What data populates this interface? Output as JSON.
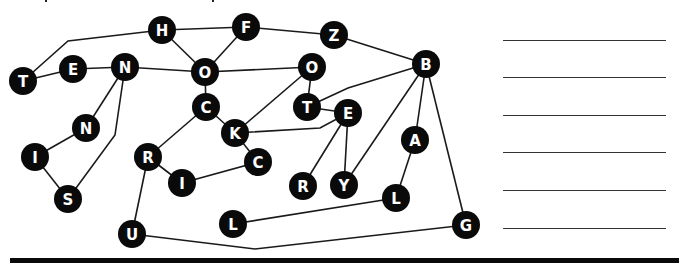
{
  "puzzle": {
    "type": "letter-path-graph",
    "nodes": [
      {
        "id": "H",
        "label": "H",
        "x": 162,
        "y": 30
      },
      {
        "id": "F",
        "label": "F",
        "x": 246,
        "y": 27
      },
      {
        "id": "Z",
        "label": "Z",
        "x": 334,
        "y": 35
      },
      {
        "id": "B",
        "label": "B",
        "x": 426,
        "y": 64
      },
      {
        "id": "T1",
        "label": "T",
        "x": 23,
        "y": 81
      },
      {
        "id": "E1",
        "label": "E",
        "x": 73,
        "y": 69
      },
      {
        "id": "N1",
        "label": "N",
        "x": 125,
        "y": 67
      },
      {
        "id": "O1",
        "label": "O",
        "x": 205,
        "y": 72
      },
      {
        "id": "O2",
        "label": "O",
        "x": 312,
        "y": 67
      },
      {
        "id": "C1",
        "label": "C",
        "x": 206,
        "y": 107
      },
      {
        "id": "T2",
        "label": "T",
        "x": 307,
        "y": 107
      },
      {
        "id": "E2",
        "label": "E",
        "x": 348,
        "y": 113
      },
      {
        "id": "K",
        "label": "K",
        "x": 235,
        "y": 133
      },
      {
        "id": "N2",
        "label": "N",
        "x": 86,
        "y": 128
      },
      {
        "id": "I1",
        "label": "I",
        "x": 35,
        "y": 157
      },
      {
        "id": "R1",
        "label": "R",
        "x": 148,
        "y": 157
      },
      {
        "id": "C2",
        "label": "C",
        "x": 258,
        "y": 162
      },
      {
        "id": "A",
        "label": "A",
        "x": 415,
        "y": 140
      },
      {
        "id": "I2",
        "label": "I",
        "x": 182,
        "y": 183
      },
      {
        "id": "S",
        "label": "S",
        "x": 68,
        "y": 199
      },
      {
        "id": "R2",
        "label": "R",
        "x": 303,
        "y": 186
      },
      {
        "id": "Y",
        "label": "Y",
        "x": 344,
        "y": 185
      },
      {
        "id": "L2",
        "label": "L",
        "x": 396,
        "y": 198
      },
      {
        "id": "L1",
        "label": "L",
        "x": 233,
        "y": 224
      },
      {
        "id": "G",
        "label": "G",
        "x": 466,
        "y": 225
      },
      {
        "id": "U",
        "label": "U",
        "x": 132,
        "y": 234
      }
    ],
    "edges": [
      {
        "from": "T1",
        "to": "E1",
        "via": []
      },
      {
        "from": "T1",
        "to": "H",
        "via": [
          [
            68,
            41
          ]
        ]
      },
      {
        "from": "E1",
        "to": "N1",
        "via": []
      },
      {
        "from": "N1",
        "to": "O1",
        "via": []
      },
      {
        "from": "H",
        "to": "O1",
        "via": []
      },
      {
        "from": "H",
        "to": "F",
        "via": []
      },
      {
        "from": "F",
        "to": "O1",
        "via": []
      },
      {
        "from": "F",
        "to": "Z",
        "via": []
      },
      {
        "from": "Z",
        "to": "B",
        "via": []
      },
      {
        "from": "O1",
        "to": "O2",
        "via": []
      },
      {
        "from": "O1",
        "to": "C1",
        "via": []
      },
      {
        "from": "O2",
        "to": "T2",
        "via": []
      },
      {
        "from": "O2",
        "to": "K",
        "via": []
      },
      {
        "from": "T2",
        "to": "E2",
        "via": []
      },
      {
        "from": "T2",
        "to": "B",
        "via": [
          [
            348,
            88
          ]
        ]
      },
      {
        "from": "C1",
        "to": "K",
        "via": []
      },
      {
        "from": "C1",
        "to": "R1",
        "via": []
      },
      {
        "from": "K",
        "to": "E2",
        "via": [
          [
            320,
            128
          ]
        ]
      },
      {
        "from": "K",
        "to": "C2",
        "via": []
      },
      {
        "from": "E2",
        "to": "R2",
        "via": []
      },
      {
        "from": "E2",
        "to": "Y",
        "via": []
      },
      {
        "from": "B",
        "to": "Y",
        "via": []
      },
      {
        "from": "B",
        "to": "A",
        "via": []
      },
      {
        "from": "B",
        "to": "G",
        "via": []
      },
      {
        "from": "A",
        "to": "L2",
        "via": []
      },
      {
        "from": "L2",
        "to": "L1",
        "via": []
      },
      {
        "from": "R1",
        "to": "I2",
        "via": []
      },
      {
        "from": "I2",
        "to": "C2",
        "via": []
      },
      {
        "from": "R1",
        "to": "U",
        "via": []
      },
      {
        "from": "U",
        "to": "G",
        "via": [
          [
            255,
            249
          ]
        ]
      },
      {
        "from": "N1",
        "to": "N2",
        "via": []
      },
      {
        "from": "N2",
        "to": "I1",
        "via": []
      },
      {
        "from": "I1",
        "to": "S",
        "via": []
      },
      {
        "from": "N1",
        "to": "S",
        "via": [
          [
            115,
            135
          ]
        ]
      }
    ],
    "node_radius": 14
  },
  "answer_lines": {
    "count": 6,
    "y_positions": [
      40,
      77,
      115,
      152,
      190,
      228
    ]
  },
  "colors": {
    "node_fill": "#0a0a0a",
    "node_text": "#ffffff",
    "edge": "#1a1a1a",
    "rule": "#0a0a0a",
    "background": "#ffffff"
  }
}
